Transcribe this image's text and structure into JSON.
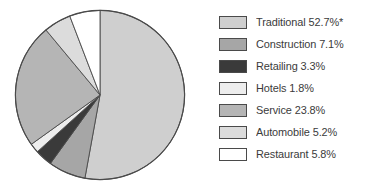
{
  "chart_data": {
    "type": "pie",
    "title": "",
    "subtitle": "",
    "xlabel": "",
    "ylabel": "",
    "legend_position": "right",
    "grid": false,
    "start_angle_deg": 0,
    "direction": "clockwise",
    "units": "percent",
    "categories": [
      "Traditional",
      "Construction",
      "Retailing",
      "Hotels",
      "Service",
      "Automobile",
      "Restaurant"
    ],
    "values": [
      52.7,
      7.1,
      3.3,
      1.8,
      23.8,
      5.2,
      5.8
    ],
    "labels": [
      "Traditional 52.7%*",
      "Construction 7.1%",
      "Retailing 3.3%",
      "Hotels 1.8%",
      "Service 23.8%",
      "Automobile 5.2%",
      "Restaurant 5.8%"
    ],
    "slice_colors": [
      "#cfcfcf",
      "#a6a6a6",
      "#3a3a3a",
      "#ededed",
      "#b5b5b5",
      "#dcdcdc",
      "#ffffff"
    ],
    "annotations": [
      "*"
    ],
    "slices": [
      {
        "name": "Traditional",
        "value": 52.7,
        "label": "Traditional 52.7%*",
        "color": "#cfcfcf"
      },
      {
        "name": "Construction",
        "value": 7.1,
        "label": "Construction 7.1%",
        "color": "#a6a6a6"
      },
      {
        "name": "Retailing",
        "value": 3.3,
        "label": "Retailing 3.3%",
        "color": "#3a3a3a"
      },
      {
        "name": "Hotels",
        "value": 1.8,
        "label": "Hotels 1.8%",
        "color": "#ededed"
      },
      {
        "name": "Service",
        "value": 23.8,
        "label": "Service 23.8%",
        "color": "#b5b5b5"
      },
      {
        "name": "Automobile",
        "value": 5.2,
        "label": "Automobile 5.2%",
        "color": "#dcdcdc"
      },
      {
        "name": "Restaurant",
        "value": 5.8,
        "label": "Restaurant 5.8%",
        "color": "#ffffff"
      }
    ]
  },
  "style": {
    "background": "#ffffff",
    "outline_color": "#4a4a4a",
    "text_color": "#3b3b3b"
  },
  "legend": {
    "rows": [
      {
        "label": "Traditional 52.7%*",
        "color": "#cfcfcf"
      },
      {
        "label": "Construction 7.1%",
        "color": "#a6a6a6"
      },
      {
        "label": "Retailing 3.3%",
        "color": "#3a3a3a"
      },
      {
        "label": "Hotels 1.8%",
        "color": "#ededed"
      },
      {
        "label": "Service 23.8%",
        "color": "#b5b5b5"
      },
      {
        "label": "Automobile 5.2%",
        "color": "#dcdcdc"
      },
      {
        "label": "Restaurant 5.8%",
        "color": "#ffffff"
      }
    ]
  }
}
